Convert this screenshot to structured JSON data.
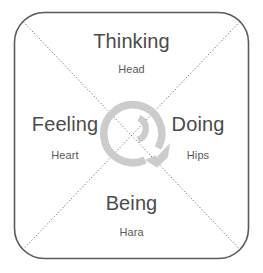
{
  "diagram": {
    "name": "four-quadrant-model",
    "frame": {
      "shape": "rounded-square",
      "stroke_color": "#5a5a5a",
      "fill_color": "#ffffff"
    },
    "diagonals": {
      "style": "dotted",
      "color": "#555555"
    },
    "center_icon": {
      "name": "cycle-arrow-icon",
      "color": "#c9c9c9",
      "description": "spiral circular arrow"
    },
    "quadrants": [
      {
        "position": "top",
        "title": "Thinking",
        "subtitle": "Head"
      },
      {
        "position": "left",
        "title": "Feeling",
        "subtitle": "Heart"
      },
      {
        "position": "right",
        "title": "Doing",
        "subtitle": "Hips"
      },
      {
        "position": "bottom",
        "title": "Being",
        "subtitle": "Hara"
      }
    ]
  }
}
